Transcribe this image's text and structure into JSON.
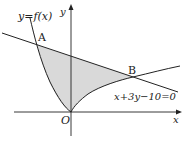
{
  "diagram": {
    "curve_label": "y=f(x)",
    "line_label": "x+3y−10=0",
    "x_axis_label": "x",
    "y_axis_label": "y",
    "origin_label": "O",
    "point_a_label": "A",
    "point_b_label": "B",
    "colors": {
      "stroke": "#222222",
      "shade": "#d9d9d9"
    }
  }
}
